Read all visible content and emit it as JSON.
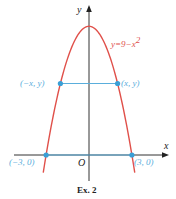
{
  "figure": {
    "caption": "Ex. 2",
    "axes": {
      "x_label": "x",
      "y_label": "y",
      "origin_label": "O"
    },
    "curve": {
      "equation": "y = 9 − x²",
      "eq_text": "y=9−x",
      "eq_sup": "2",
      "color": "#e0504a"
    },
    "chart_data": {
      "type": "line",
      "title": "",
      "xlabel": "x",
      "ylabel": "y",
      "xlim": [
        -3.1,
        5.5
      ],
      "ylim": [
        -1.8,
        10.5
      ],
      "grid": false,
      "series": [
        {
          "name": "y = 9 − x²",
          "function": "9 - x^2",
          "x_range": [
            -3.2,
            3.2
          ],
          "color": "#e0504a"
        }
      ],
      "horizontal_segments": [
        {
          "name": "chord",
          "y": 5,
          "x_from": -2,
          "x_to": 2,
          "color": "#5aaedc"
        },
        {
          "name": "base",
          "y": 0,
          "x_from": -3,
          "x_to": 3,
          "color": "#5aaedc"
        }
      ],
      "points": [
        {
          "x": -2,
          "y": 5,
          "label": "(−x, y)"
        },
        {
          "x": 2,
          "y": 5,
          "label": "(x, y)"
        },
        {
          "x": -3,
          "y": 0,
          "label": "(−3, 0)"
        },
        {
          "x": 3,
          "y": 0,
          "label": "(3, 0)"
        }
      ],
      "annotations": [
        "y = 9 − x²",
        "O"
      ]
    },
    "point_labels": {
      "neg_xy": "(−x, y)",
      "pos_xy": "(x, y)",
      "neg3": "(−3, 0)",
      "pos3": "(3, 0)"
    },
    "colors": {
      "axis": "#333333",
      "curve": "#e0504a",
      "segment": "#5aaedc",
      "point": "#3a9fd6"
    }
  }
}
